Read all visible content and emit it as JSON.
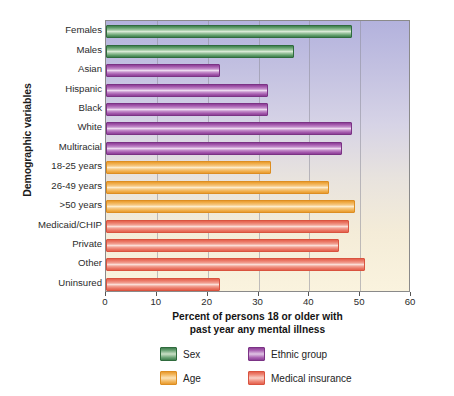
{
  "chart_data": {
    "type": "bar",
    "orientation": "horizontal",
    "title": "",
    "xlabel": "Percent of persons 18 or older with past year any mental illness",
    "ylabel": "Demographic variables",
    "xlim": [
      0,
      60
    ],
    "xticks": [
      0,
      10,
      20,
      30,
      40,
      50,
      60
    ],
    "grid": true,
    "legend_position": "bottom",
    "categories": [
      "Females",
      "Males",
      "Asian",
      "Hispanic",
      "Black",
      "White",
      "Multiracial",
      "18-25 years",
      "26-49 years",
      ">50 years",
      "Medicaid/CHIP",
      "Private",
      "Other",
      "Uninsured"
    ],
    "values": [
      48,
      36.5,
      22,
      31.5,
      31.5,
      48,
      46,
      32,
      43.5,
      48.5,
      47.5,
      45.5,
      50.5,
      22
    ],
    "groups": [
      "Sex",
      "Sex",
      "Ethnic group",
      "Ethnic group",
      "Ethnic group",
      "Ethnic group",
      "Ethnic group",
      "Age",
      "Age",
      "Age",
      "Medical insurance",
      "Medical insurance",
      "Medical insurance",
      "Medical insurance"
    ],
    "series": [
      {
        "name": "Sex",
        "color": "#5d9b68",
        "points": [
          {
            "label": "Females",
            "value": 48
          },
          {
            "label": "Males",
            "value": 36.5
          }
        ]
      },
      {
        "name": "Ethnic group",
        "color": "#a257ab",
        "points": [
          {
            "label": "Asian",
            "value": 22
          },
          {
            "label": "Hispanic",
            "value": 31.5
          },
          {
            "label": "Black",
            "value": 31.5
          },
          {
            "label": "White",
            "value": 48
          },
          {
            "label": "Multiracial",
            "value": 46
          }
        ]
      },
      {
        "name": "Age",
        "color": "#f0ad49",
        "points": [
          {
            "label": "18-25 years",
            "value": 32
          },
          {
            "label": "26-49 years",
            "value": 43.5
          },
          {
            "label": ">50 years",
            "value": 48.5
          }
        ]
      },
      {
        "name": "Medical insurance",
        "color": "#ea7664",
        "points": [
          {
            "label": "Medicaid/CHIP",
            "value": 47.5
          },
          {
            "label": "Private",
            "value": 45.5
          },
          {
            "label": "Other",
            "value": 50.5
          },
          {
            "label": "Uninsured",
            "value": 22
          }
        ]
      }
    ]
  },
  "axes": {
    "y_title": "Demographic variables",
    "x_title_line1": "Percent of persons 18 or older with",
    "x_title_line2": "past year any mental illness",
    "x_tick_labels": [
      "0",
      "10",
      "20",
      "30",
      "40",
      "50",
      "60"
    ]
  },
  "legend": {
    "items": [
      {
        "label": "Sex",
        "color": "#5d9b68",
        "swatch": "sex"
      },
      {
        "label": "Ethnic group",
        "color": "#a257ab",
        "swatch": "ethnic"
      },
      {
        "label": "Age",
        "color": "#f0ad49",
        "swatch": "age"
      },
      {
        "label": "Medical insurance",
        "color": "#ea7664",
        "swatch": "insurance"
      }
    ]
  },
  "style": {
    "plot_bg_top": "#b3b2dd",
    "plot_bg_bottom": "#faf3de",
    "axis_color": "#8a8a8a",
    "grid_color": "#8e8e9a"
  }
}
